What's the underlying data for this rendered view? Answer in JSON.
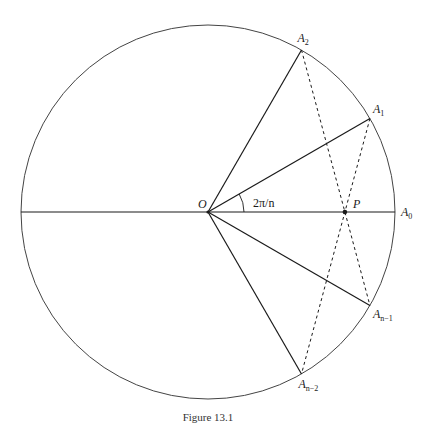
{
  "figure": {
    "caption": "Figure 13.1",
    "n_shown_as_12": 12,
    "center_label": "O",
    "intersection_label": "P",
    "angle_label": "2π/n",
    "points": [
      {
        "id": "A0",
        "base": "A",
        "sub": "0",
        "angle_deg": 0
      },
      {
        "id": "A1",
        "base": "A",
        "sub": "1",
        "angle_deg": 30
      },
      {
        "id": "A2",
        "base": "A",
        "sub": "2",
        "angle_deg": 60
      },
      {
        "id": "An-1",
        "base": "A",
        "sub": "n−1",
        "angle_deg": -30
      },
      {
        "id": "An-2",
        "base": "A",
        "sub": "n−2",
        "angle_deg": -60
      }
    ],
    "solid_radii": [
      "A0",
      "A1",
      "A2",
      "An-1",
      "An-2",
      "W"
    ],
    "dashed_chords": [
      [
        "A2",
        "An-1"
      ],
      [
        "A1",
        "An-2"
      ]
    ]
  },
  "colors": {
    "stroke": "#1a1a1a",
    "circle": "#444444"
  }
}
